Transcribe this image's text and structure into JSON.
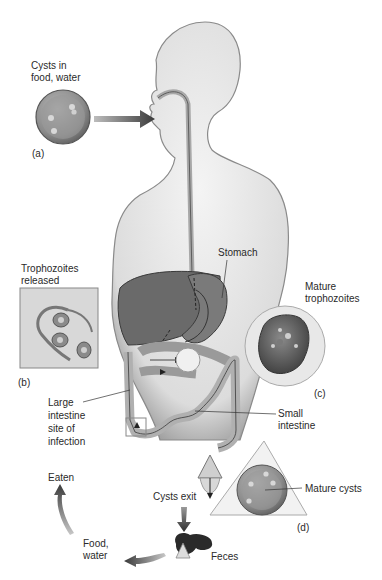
{
  "diagram": {
    "labels": {
      "cysts_in_food": "Cysts in\nfood, water",
      "panel_a": "(a)",
      "trophozoites_released": "Trophozoites\nreleased",
      "panel_b": "(b)",
      "stomach": "Stomach",
      "mature_trophozoites": "Mature\ntrophozoites",
      "panel_c": "(c)",
      "large_intestine": "Large\nintestine\nsite of\ninfection",
      "small_intestine": "Small\nintestine",
      "cysts_exit": "Cysts exit",
      "mature_cysts": "Mature cysts",
      "panel_d": "(d)",
      "eaten": "Eaten",
      "food_water": "Food,\nwater",
      "feces": "Feces"
    },
    "colors": {
      "background": "#ffffff",
      "body_fill": "#e6e6e6",
      "body_edge": "#8a8a8a",
      "organ_dark": "#5a5a5a",
      "organ_mid": "#9a9a9a",
      "arrow": "#3a3a3a",
      "text": "#2a2a2a"
    }
  }
}
